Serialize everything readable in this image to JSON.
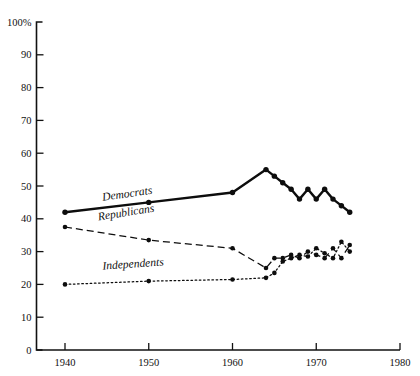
{
  "chart_data": {
    "type": "line",
    "title": "",
    "xlabel": "",
    "ylabel": "",
    "xlim": [
      1936,
      1981
    ],
    "ylim": [
      0,
      100
    ],
    "grid": false,
    "legend_position": "inline-labels",
    "y_ticks": [
      "0",
      "10",
      "20",
      "30",
      "40",
      "50",
      "60",
      "70",
      "80",
      "90",
      "100%"
    ],
    "y_tick_values": [
      0,
      10,
      20,
      30,
      40,
      50,
      60,
      70,
      80,
      90,
      100
    ],
    "x_ticks": [
      "1940",
      "1950",
      "1960",
      "1970",
      "1980"
    ],
    "x_tick_values": [
      1940,
      1950,
      1960,
      1970,
      1980
    ],
    "series": [
      {
        "name": "Democrats",
        "style": "solid",
        "marker": "filled-circle",
        "x": [
          1940,
          1950,
          1960,
          1964,
          1965,
          1966,
          1967,
          1968,
          1969,
          1970,
          1971,
          1972,
          1973,
          1974
        ],
        "values": [
          42,
          45,
          48,
          55,
          53,
          51,
          49,
          46,
          49,
          46,
          49,
          46,
          44,
          42
        ]
      },
      {
        "name": "Republicans",
        "style": "dashed",
        "marker": "filled-circle",
        "x": [
          1940,
          1950,
          1960,
          1964,
          1965,
          1966,
          1967,
          1968,
          1969,
          1970,
          1971,
          1972,
          1973,
          1974
        ],
        "values": [
          37.5,
          33.5,
          31,
          25,
          28,
          28,
          29,
          28,
          30,
          29,
          28,
          31,
          28,
          32
        ]
      },
      {
        "name": "Independents",
        "style": "dotted",
        "marker": "filled-circle",
        "x": [
          1940,
          1950,
          1960,
          1964,
          1965,
          1966,
          1967,
          1968,
          1969,
          1970,
          1971,
          1972,
          1973,
          1974
        ],
        "values": [
          20,
          21,
          21.5,
          22,
          23.5,
          27,
          28,
          29,
          28.5,
          31,
          29.5,
          28,
          33,
          30
        ]
      }
    ],
    "annotations": [
      {
        "text": "Democrats",
        "x": 1944.5,
        "y": 45.5
      },
      {
        "text": "Republicans",
        "x": 1944.0,
        "y": 39.5
      },
      {
        "text": "Independents",
        "x": 1944.5,
        "y": 24.5
      }
    ]
  }
}
